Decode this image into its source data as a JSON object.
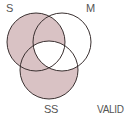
{
  "diagram": {
    "type": "venn",
    "circles": [
      {
        "label": "S",
        "cx": 36,
        "cy": 42,
        "r": 29
      },
      {
        "label": "M",
        "cx": 62,
        "cy": 42,
        "r": 29
      },
      {
        "label": "SS",
        "cx": 49,
        "cy": 70,
        "r": 29
      }
    ],
    "shaded_regions": [
      "S only",
      "S∩M only",
      "S∩SS only",
      "SS only"
    ],
    "unshaded_regions": [
      "M only",
      "M∩SS only",
      "S∩M∩SS"
    ],
    "shade_color": "#d9c2c4",
    "stroke_color": "#3a3030",
    "verdict": "VALID"
  },
  "labels": {
    "s": "S",
    "m": "M",
    "ss": "SS",
    "verdict": "VALID"
  }
}
